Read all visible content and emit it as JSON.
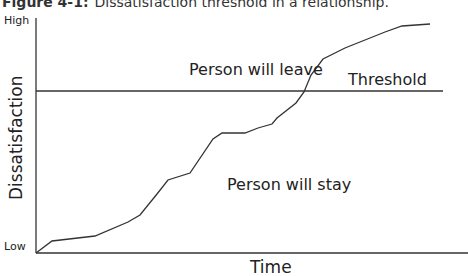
{
  "caption": {
    "figure_label": "Figure 4-1:",
    "text": "Dissatisfaction threshold in a relationship."
  },
  "chart_data": {
    "type": "line",
    "title": "Dissatisfaction threshold in a relationship.",
    "xlabel": "Time",
    "ylabel": "Dissatisfaction",
    "y_tick_labels": [
      "Low",
      "High"
    ],
    "threshold_label": "Threshold",
    "annotations": [
      "Person will leave",
      "Person will stay"
    ],
    "grid": false,
    "series": [
      {
        "name": "Dissatisfaction",
        "points_px": [
          [
            36,
            253
          ],
          [
            52,
            241
          ],
          [
            95,
            236
          ],
          [
            128,
            222
          ],
          [
            140,
            215
          ],
          [
            157,
            194
          ],
          [
            168,
            180
          ],
          [
            190,
            173
          ],
          [
            213,
            139
          ],
          [
            222,
            133
          ],
          [
            245,
            133
          ],
          [
            258,
            128
          ],
          [
            272,
            124
          ],
          [
            277,
            118
          ],
          [
            296,
            103
          ],
          [
            304,
            92
          ],
          [
            311,
            75
          ],
          [
            323,
            59
          ],
          [
            345,
            48
          ],
          [
            370,
            38
          ],
          [
            385,
            32
          ],
          [
            402,
            26
          ],
          [
            430,
            24
          ]
        ]
      }
    ],
    "threshold_y_px": 91
  }
}
